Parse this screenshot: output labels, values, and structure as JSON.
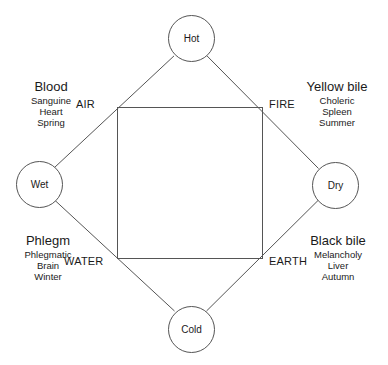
{
  "diagram": {
    "background_color": "#ffffff",
    "line_color": "#555555",
    "text_color": "#1a1a1a",
    "qualities": [
      {
        "id": "hot",
        "label": "Hot",
        "position": "top"
      },
      {
        "id": "wet",
        "label": "Wet",
        "position": "left"
      },
      {
        "id": "dry",
        "label": "Dry",
        "position": "right"
      },
      {
        "id": "cold",
        "label": "Cold",
        "position": "bottom"
      }
    ],
    "elements": [
      {
        "id": "air",
        "label": "AIR",
        "position": "top-left"
      },
      {
        "id": "fire",
        "label": "FIRE",
        "position": "top-right"
      },
      {
        "id": "water",
        "label": "WATER",
        "position": "bottom-left"
      },
      {
        "id": "earth",
        "label": "EARTH",
        "position": "bottom-right"
      }
    ],
    "humors": [
      {
        "id": "blood",
        "title": "Blood",
        "temperament": "Sanguine",
        "organ": "Heart",
        "season": "Spring",
        "corner": "top-left"
      },
      {
        "id": "yellow-bile",
        "title": "Yellow bile",
        "temperament": "Choleric",
        "organ": "Spleen",
        "season": "Summer",
        "corner": "top-right"
      },
      {
        "id": "phlegm",
        "title": "Phlegm",
        "temperament": "Phlegmatic",
        "organ": "Brain",
        "season": "Winter",
        "corner": "bottom-left"
      },
      {
        "id": "black-bile",
        "title": "Black bile",
        "temperament": "Melancholy",
        "organ": "Liver",
        "season": "Autumn",
        "corner": "bottom-right"
      }
    ]
  }
}
